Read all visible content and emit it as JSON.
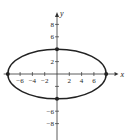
{
  "chart_data": {
    "type": "line",
    "title": "",
    "xlabel": "x",
    "ylabel": "y",
    "xlim": [
      -9,
      10
    ],
    "ylim": [
      -10,
      10
    ],
    "curve": {
      "shape": "ellipse",
      "center": [
        0,
        0
      ],
      "semi_axis_x": 8,
      "semi_axis_y": 4
    },
    "points": [
      {
        "x": 8,
        "y": 0
      },
      {
        "x": -8,
        "y": 0
      },
      {
        "x": 0,
        "y": 4
      },
      {
        "x": 0,
        "y": -4
      }
    ],
    "x_ticks": [
      -6,
      -4,
      -2,
      2,
      4,
      6
    ],
    "x_tick_labels": [
      "−6",
      "−4",
      "−2",
      "2",
      "4",
      "6"
    ],
    "y_ticks": [
      8,
      6,
      2,
      -6,
      -8
    ],
    "y_tick_labels": [
      "8",
      "6",
      "2",
      "−6",
      "−8"
    ],
    "y_minor_ticks": [
      4,
      -2,
      -4
    ],
    "grid": false,
    "colors": {
      "curve": "#222222",
      "axis": "#333333"
    }
  }
}
